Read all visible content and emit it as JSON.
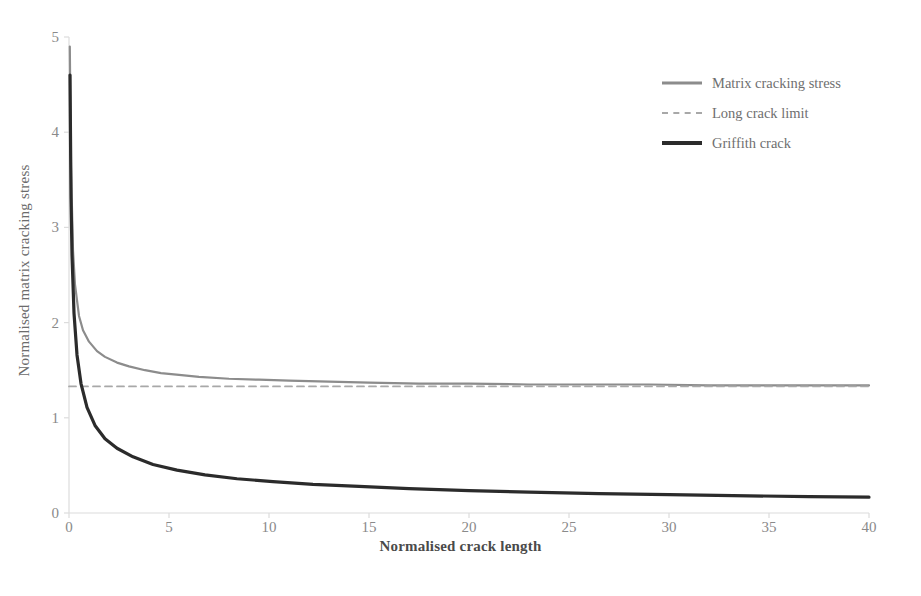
{
  "chart_data": {
    "type": "line",
    "title": "",
    "xlabel": "Normalised crack length",
    "ylabel": "Normalised matrix cracking stress",
    "xlim": [
      0,
      40
    ],
    "ylim": [
      0,
      5
    ],
    "xticks": [
      "0",
      "5",
      "10",
      "15",
      "20",
      "25",
      "30",
      "35",
      "40"
    ],
    "yticks": [
      "0",
      "1",
      "2",
      "3",
      "4",
      "5"
    ],
    "grid": false,
    "legend_position": "top-right",
    "long_crack_limit": 1.33,
    "series": [
      {
        "name": "Matrix cracking stress",
        "style": "solid",
        "color": "#8c8c8c",
        "width": 2.2,
        "x": [
          0.04,
          0.1,
          0.2,
          0.3,
          0.5,
          0.7,
          1.0,
          1.4,
          1.8,
          2.4,
          3.0,
          3.8,
          4.6,
          5.5,
          6.5,
          8.0,
          9.5,
          11.0,
          13.0,
          15.0,
          17.5,
          20.0,
          23.0,
          26.0,
          29.0,
          32.0,
          35.0,
          38.0,
          40.0
        ],
        "y": [
          4.9,
          3.63,
          2.76,
          2.4,
          2.07,
          1.92,
          1.8,
          1.7,
          1.64,
          1.58,
          1.54,
          1.5,
          1.47,
          1.45,
          1.43,
          1.41,
          1.4,
          1.39,
          1.38,
          1.37,
          1.36,
          1.36,
          1.35,
          1.35,
          1.35,
          1.34,
          1.34,
          1.34,
          1.34
        ]
      },
      {
        "name": "Long crack limit",
        "style": "dashed",
        "color": "#a8a8a8",
        "width": 1.8,
        "x": [
          0,
          40
        ],
        "y": [
          1.33,
          1.33
        ]
      },
      {
        "name": "Griffith crack",
        "style": "solid",
        "color": "#2b2b2b",
        "width": 3.2,
        "x": [
          0.05,
          0.1,
          0.15,
          0.25,
          0.4,
          0.6,
          0.9,
          1.3,
          1.8,
          2.4,
          3.2,
          4.2,
          5.4,
          6.8,
          8.4,
          10.2,
          12.2,
          14.5,
          17.0,
          20.0,
          23.0,
          26.5,
          30.0,
          34.0,
          37.0,
          40.0
        ],
        "y": [
          4.6,
          3.32,
          2.71,
          2.1,
          1.66,
          1.36,
          1.11,
          0.92,
          0.78,
          0.68,
          0.59,
          0.51,
          0.45,
          0.4,
          0.36,
          0.33,
          0.3,
          0.28,
          0.255,
          0.235,
          0.219,
          0.204,
          0.192,
          0.18,
          0.173,
          0.166
        ]
      }
    ]
  },
  "legend": {
    "items": [
      {
        "label": "Matrix cracking stress",
        "swatch": "solid-gray"
      },
      {
        "label": "Long crack limit",
        "swatch": "dashed-gray"
      },
      {
        "label": "Griffith crack",
        "swatch": "solid-black"
      }
    ]
  },
  "axes": {
    "x_title": "Normalised crack length",
    "y_title": "Normalised matrix cracking stress",
    "x_tick_labels": [
      "0",
      "5",
      "10",
      "15",
      "20",
      "25",
      "30",
      "35",
      "40"
    ],
    "y_tick_labels": [
      "0",
      "1",
      "2",
      "3",
      "4",
      "5"
    ]
  },
  "colors": {
    "background": "#ffffff",
    "axis_line": "#dcdcdc",
    "tick_text": "#8a8a8a",
    "title_text": "#4a4a4a",
    "matrix_curve": "#8c8c8c",
    "limit_curve": "#a8a8a8",
    "griffith_curve": "#2b2b2b"
  }
}
